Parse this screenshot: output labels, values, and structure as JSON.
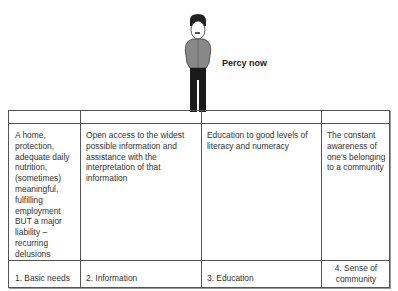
{
  "figure": {
    "label": "Percy now",
    "icon": "person-figure-icon"
  },
  "table": {
    "descriptions": [
      "A home, protection, adequate daily nutrition, (sometimes) meaningful, fulfilling employment BUT a major liability – recurring delusions",
      "Open access to the widest possible information and assistance with the interpretation of that information",
      "Education to good levels of literacy and numeracy",
      "The constant awareness of one's belonging to a community"
    ],
    "categories": [
      "1.  Basic needs",
      "2.  Information",
      "3.  Education",
      "4.  Sense of community"
    ]
  }
}
